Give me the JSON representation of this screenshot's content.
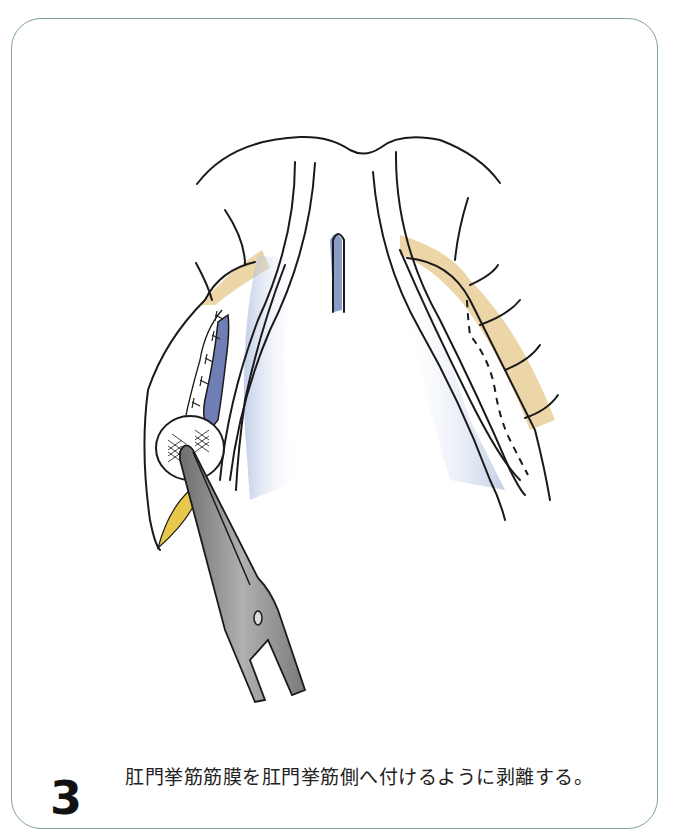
{
  "figure": {
    "step_number": "3",
    "caption": "肛門挙筋筋膜を肛門挙筋側へ付けるように剥離する。",
    "frame_color": "#7fa58e",
    "illustration": {
      "description": "Surgical illustration: dissection of levator ani fascia toward the levator ani muscle side using forceps holding a gauze",
      "colors": {
        "outline": "#1a1a1a",
        "tissue_blue": "#9fb3d9",
        "vessel_blue": "#6f7fb5",
        "fat_yellow": "#e6c88a",
        "instrument_gray": "#8a8a8a",
        "gauze_yellow": "#e8c84a"
      },
      "elements": [
        "left-tissue-flap",
        "right-tissue-flap",
        "central-groove",
        "sutured-vessel",
        "gauze-ball",
        "forceps",
        "dashed-incision-line"
      ]
    }
  }
}
